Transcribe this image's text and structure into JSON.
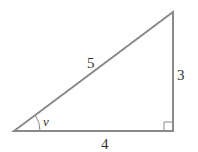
{
  "diagram": {
    "type": "right-triangle",
    "sides": {
      "hypotenuse": "5",
      "vertical_leg": "3",
      "horizontal_leg": "4"
    },
    "angle_label": "v",
    "colors": {
      "stroke": "#8a8a8a",
      "text": "#333333"
    }
  }
}
